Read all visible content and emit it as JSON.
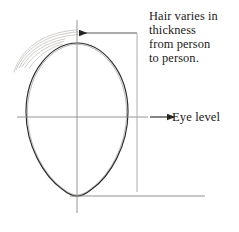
{
  "figure": {
    "background_color": "#ffffff",
    "ink_color": "#262321",
    "faint_ink_color": "#b9b6b4",
    "width": 239,
    "height": 232
  },
  "annotations": {
    "hair_note": {
      "full_text": "Hair varies in thickness from person to person.",
      "lines": [
        "Hair varies in",
        "thickness",
        "from person",
        "to person."
      ]
    },
    "eye_level": {
      "label": "Eye level"
    }
  },
  "construction": {
    "egg_outline_name": "head-egg-outline",
    "vertical_axis_name": "vertical-center-axis",
    "eye_level_line_name": "eye-level-line",
    "hair_sketch_name": "hair-sketch-strokes",
    "hair_leader_name": "hair-leader-line",
    "baseline_name": "chin-baseline"
  }
}
